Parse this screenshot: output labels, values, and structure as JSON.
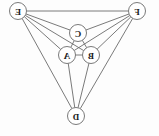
{
  "figure": {
    "kind": "undirected-graph-diagram",
    "width": 159,
    "height": 136,
    "background_color": "#fdfdfd",
    "mirrored": "true",
    "stroke_color": "#6b6b6b",
    "node_fill_color": "#ffffff",
    "label_color": "#1a1a1a",
    "node_radius": 8.5
  },
  "nodes": [
    {
      "id": "F",
      "label": "F",
      "x": 22,
      "y": 11
    },
    {
      "id": "E",
      "label": "E",
      "x": 141,
      "y": 11
    },
    {
      "id": "C",
      "label": "C",
      "x": 81,
      "y": 33
    },
    {
      "id": "B",
      "label": "B",
      "x": 68,
      "y": 55
    },
    {
      "id": "A",
      "label": "A",
      "x": 92,
      "y": 55
    },
    {
      "id": "D",
      "label": "D",
      "x": 83,
      "y": 116
    }
  ],
  "edges": [
    {
      "from": "F",
      "to": "E"
    },
    {
      "from": "F",
      "to": "C"
    },
    {
      "from": "F",
      "to": "B"
    },
    {
      "from": "F",
      "to": "A"
    },
    {
      "from": "F",
      "to": "D"
    },
    {
      "from": "E",
      "to": "C"
    },
    {
      "from": "E",
      "to": "A"
    },
    {
      "from": "E",
      "to": "B"
    },
    {
      "from": "E",
      "to": "D"
    },
    {
      "from": "C",
      "to": "B"
    },
    {
      "from": "C",
      "to": "A"
    },
    {
      "from": "B",
      "to": "A"
    },
    {
      "from": "B",
      "to": "D"
    },
    {
      "from": "A",
      "to": "D"
    }
  ]
}
